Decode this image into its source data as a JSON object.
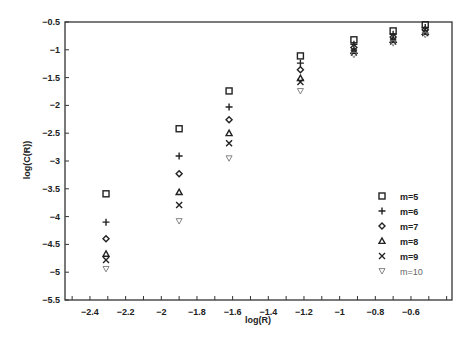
{
  "chart_data": {
    "type": "scatter",
    "title": "",
    "xlabel": "log(R)",
    "ylabel": "log(C(R))",
    "xlim": [
      -2.54,
      -0.37
    ],
    "ylim": [
      -5.5,
      -0.5
    ],
    "xticks": [
      -2.4,
      -2.2,
      -2,
      -1.8,
      -1.6,
      -1.4,
      -1.2,
      -1,
      -0.8,
      -0.6
    ],
    "xtick_labels": [
      "-2.4",
      "-2.2",
      "-2",
      "-1.8",
      "-1.6",
      "-1.4",
      "-1.2",
      "-1",
      "-0.8",
      "-0.6"
    ],
    "xminor_step": 0.1,
    "yticks": [
      -0.5,
      -1,
      -1.5,
      -2,
      -2.5,
      -3,
      -3.5,
      -4,
      -4.5,
      -5,
      -5.5
    ],
    "ytick_labels": [
      "-0.5",
      "-1",
      "-1.5",
      "-2",
      "-2.5",
      "-3",
      "-3.5",
      "-4",
      "-4.5",
      "-5",
      "-5.5"
    ],
    "grid": false,
    "legend_position": "lower right",
    "x": [
      -2.31,
      -1.9,
      -1.62,
      -1.22,
      -0.92,
      -0.7,
      -0.52
    ],
    "series": [
      {
        "name": "m=5",
        "marker": "square",
        "values": [
          -3.59,
          -2.42,
          -1.74,
          -1.11,
          -0.82,
          -0.66,
          -0.55
        ]
      },
      {
        "name": "m=6",
        "marker": "plus",
        "values": [
          -4.1,
          -2.91,
          -2.03,
          -1.24,
          -0.9,
          -0.72,
          -0.6
        ]
      },
      {
        "name": "m=7",
        "marker": "diamond",
        "values": [
          -4.4,
          -3.23,
          -2.26,
          -1.36,
          -0.96,
          -0.77,
          -0.64
        ]
      },
      {
        "name": "m=8",
        "marker": "triangle-up",
        "values": [
          -4.67,
          -3.56,
          -2.5,
          -1.51,
          -1.02,
          -0.82,
          -0.68
        ]
      },
      {
        "name": "m=9",
        "marker": "x",
        "values": [
          -4.78,
          -3.79,
          -2.68,
          -1.58,
          -1.05,
          -0.85,
          -0.7
        ]
      },
      {
        "name": "m=10",
        "marker": "triangle-down",
        "values": [
          -4.94,
          -4.08,
          -2.95,
          -1.74,
          -1.09,
          -0.88,
          -0.73
        ]
      }
    ]
  },
  "legend": {
    "items": [
      {
        "label": "m=5",
        "marker": "square"
      },
      {
        "label": "m=6",
        "marker": "plus"
      },
      {
        "label": "m=7",
        "marker": "diamond"
      },
      {
        "label": "m=8",
        "marker": "triangle-up"
      },
      {
        "label": "m=9",
        "marker": "x"
      },
      {
        "label": "m=10",
        "marker": "triangle-down"
      }
    ]
  },
  "colors": {
    "axis": "#333333",
    "marker": "#222222",
    "marker_light": "#777777",
    "background": "#ffffff"
  }
}
